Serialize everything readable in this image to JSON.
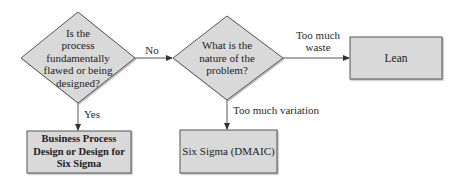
{
  "diagram": {
    "nodes": {
      "decision1": {
        "type": "decision",
        "text": "Is the process fundamentally flawed or being designed?",
        "lines": [
          "Is the",
          "process",
          "fundamentally",
          "flawed or being",
          "designed?"
        ]
      },
      "decision2": {
        "type": "decision",
        "text": "What is the nature of the problem?",
        "lines": [
          "What is the",
          "nature of the",
          "problem?"
        ]
      },
      "bpd": {
        "type": "process",
        "text": "Business Process Design or Design for Six Sigma",
        "lines": [
          "Business Process",
          "Design or Design for",
          "Six Sigma"
        ]
      },
      "sixsigma": {
        "type": "process",
        "text": "Six Sigma (DMAIC)"
      },
      "lean": {
        "type": "process",
        "text": "Lean"
      }
    },
    "edges": {
      "no": {
        "from": "decision1",
        "to": "decision2",
        "label": "No"
      },
      "yes": {
        "from": "decision1",
        "to": "bpd",
        "label": "Yes"
      },
      "waste": {
        "from": "decision2",
        "to": "lean",
        "label": "Too much waste",
        "lines": [
          "Too much",
          "waste"
        ]
      },
      "variation": {
        "from": "decision2",
        "to": "sixsigma",
        "label": "Too much variation"
      }
    },
    "colors": {
      "fill": "#d9d9d9",
      "stroke": "#555555",
      "line": "#444444"
    }
  }
}
